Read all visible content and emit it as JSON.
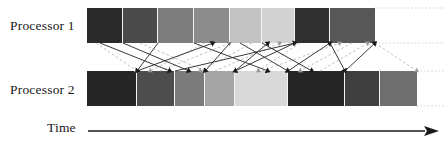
{
  "labels": {
    "processor1": "Processor 1",
    "processor2": "Processor 2",
    "time": "Time"
  },
  "colors": {
    "background": "#ffffff",
    "text": "#17181a",
    "line": "#222222",
    "dashed": "#b9b9b9",
    "dotted": "#cfcfcf"
  },
  "chart_data": {
    "type": "bar",
    "xlabel": "Time",
    "ylabel": "",
    "grid": false,
    "legend": "none",
    "categories": [
      "Processor 1",
      "Processor 2"
    ],
    "series": [
      {
        "name": "Processor 1",
        "track": {
          "x": 87,
          "y": 8,
          "width": 288,
          "height": 35
        },
        "segments": [
          {
            "index": 0,
            "x": 87,
            "width": 36,
            "shade": "#2b2b2b"
          },
          {
            "index": 1,
            "x": 123,
            "width": 35,
            "shade": "#4a4a4a"
          },
          {
            "index": 2,
            "x": 158,
            "width": 36,
            "shade": "#7d7d7d"
          },
          {
            "index": 3,
            "x": 194,
            "width": 36,
            "shade": "#8c8c8c"
          },
          {
            "index": 4,
            "x": 230,
            "width": 32,
            "shade": "#c2c2c2"
          },
          {
            "index": 5,
            "x": 262,
            "width": 33,
            "shade": "#d3d3d3"
          },
          {
            "index": 6,
            "x": 295,
            "width": 35,
            "shade": "#2f2f2f"
          },
          {
            "index": 7,
            "x": 330,
            "width": 45,
            "shade": "#575757"
          }
        ]
      },
      {
        "name": "Processor 2",
        "track": {
          "x": 87,
          "y": 71,
          "width": 330,
          "height": 35
        },
        "segments": [
          {
            "index": 0,
            "x": 87,
            "width": 50,
            "shade": "#262626"
          },
          {
            "index": 1,
            "x": 137,
            "width": 38,
            "shade": "#4d4d4d"
          },
          {
            "index": 2,
            "x": 175,
            "width": 30,
            "shade": "#7b7b7b"
          },
          {
            "index": 3,
            "x": 205,
            "width": 30,
            "shade": "#a5a5a5"
          },
          {
            "index": 4,
            "x": 235,
            "width": 53,
            "shade": "#d9d9d9"
          },
          {
            "index": 5,
            "x": 288,
            "width": 57,
            "shade": "#262626"
          },
          {
            "index": 6,
            "x": 345,
            "width": 35,
            "shade": "#3f3f3f"
          },
          {
            "index": 7,
            "x": 380,
            "width": 37,
            "shade": "#6f6f6f"
          }
        ]
      }
    ],
    "messages_solid": [
      {
        "from": [
          123,
          43
        ],
        "to": [
          189,
          71
        ]
      },
      {
        "from": [
          158,
          43
        ],
        "to": [
          137,
          71
        ]
      },
      {
        "from": [
          194,
          43
        ],
        "to": [
          268,
          71
        ]
      },
      {
        "from": [
          230,
          43
        ],
        "to": [
          205,
          71
        ]
      },
      {
        "from": [
          295,
          43
        ],
        "to": [
          235,
          71
        ]
      },
      {
        "from": [
          330,
          43
        ],
        "to": [
          345,
          71
        ]
      },
      {
        "from": [
          137,
          71
        ],
        "to": [
          213,
          43
        ]
      },
      {
        "from": [
          175,
          71
        ],
        "to": [
          295,
          43
        ]
      },
      {
        "from": [
          235,
          71
        ],
        "to": [
          268,
          43
        ]
      },
      {
        "from": [
          288,
          71
        ],
        "to": [
          330,
          43
        ]
      },
      {
        "from": [
          345,
          71
        ],
        "to": [
          375,
          43
        ]
      },
      {
        "from": [
          240,
          43
        ],
        "to": [
          288,
          71
        ]
      },
      {
        "from": [
          262,
          43
        ],
        "to": [
          312,
          71
        ]
      },
      {
        "from": [
          100,
          43
        ],
        "to": [
          170,
          71
        ]
      }
    ],
    "messages_dashed": [
      {
        "from": [
          96,
          43
        ],
        "to": [
          137,
          71
        ]
      },
      {
        "from": [
          140,
          43
        ],
        "to": [
          205,
          71
        ]
      },
      {
        "from": [
          205,
          43
        ],
        "to": [
          150,
          71
        ]
      },
      {
        "from": [
          252,
          43
        ],
        "to": [
          200,
          71
        ]
      },
      {
        "from": [
          300,
          43
        ],
        "to": [
          258,
          71
        ]
      },
      {
        "from": [
          352,
          43
        ],
        "to": [
          300,
          71
        ]
      },
      {
        "from": [
          375,
          43
        ],
        "to": [
          417,
          71
        ]
      },
      {
        "from": [
          160,
          71
        ],
        "to": [
          230,
          43
        ]
      },
      {
        "from": [
          215,
          71
        ],
        "to": [
          280,
          43
        ]
      },
      {
        "from": [
          262,
          71
        ],
        "to": [
          340,
          43
        ]
      },
      {
        "from": [
          320,
          71
        ],
        "to": [
          368,
          43
        ]
      }
    ],
    "guide_lines": [
      {
        "y": 8,
        "x1": 375,
        "x2": 444
      },
      {
        "y": 43,
        "x1": 375,
        "x2": 444
      },
      {
        "y": 71,
        "x1": 417,
        "x2": 444
      },
      {
        "y": 106,
        "x1": 417,
        "x2": 444
      }
    ],
    "time_axis": {
      "x1": 88,
      "x2": 438,
      "y": 131,
      "arrowhead": true
    }
  }
}
